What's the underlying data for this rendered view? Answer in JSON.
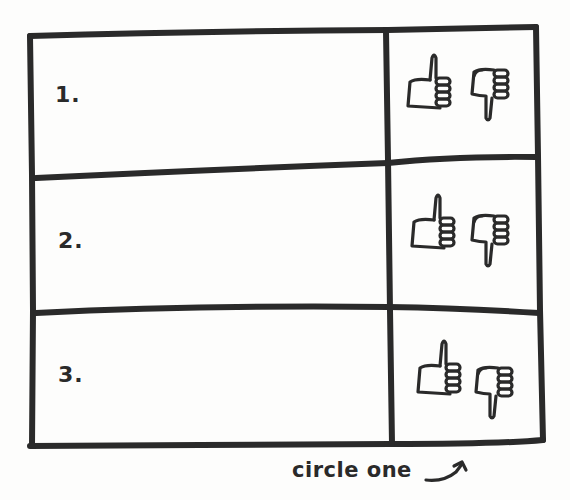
{
  "sheet": {
    "ink_color": "#2a2a2a",
    "paper_color": "#fdfdfc"
  },
  "rows": [
    {
      "label": "1.",
      "vote_options": [
        "thumbs-up",
        "thumbs-down"
      ]
    },
    {
      "label": "2.",
      "vote_options": [
        "thumbs-up",
        "thumbs-down"
      ]
    },
    {
      "label": "3.",
      "vote_options": [
        "thumbs-up",
        "thumbs-down"
      ]
    }
  ],
  "caption": {
    "text": "circle one",
    "arrow_icon": "curved-arrow-up-right-icon"
  }
}
